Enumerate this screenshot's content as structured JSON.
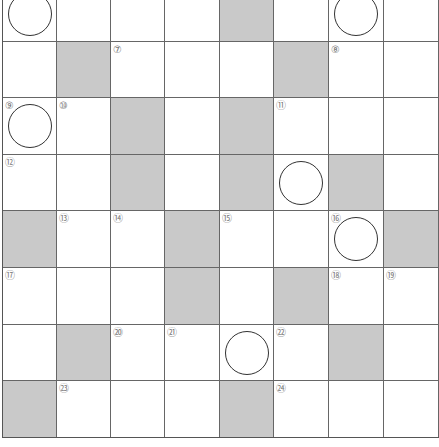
{
  "puzzle": {
    "type": "crossword-grid",
    "rows": 8,
    "cols": 8,
    "colors": {
      "block": "#c9c9c9",
      "line": "#666666",
      "ring": "#333333",
      "number": "#777777"
    },
    "cells": [
      [
        {
          "b": 0,
          "n": "",
          "c": 1
        },
        {
          "b": 0,
          "n": "",
          "c": 0
        },
        {
          "b": 0,
          "n": "",
          "c": 0
        },
        {
          "b": 0,
          "n": "",
          "c": 0
        },
        {
          "b": 1,
          "n": "",
          "c": 0
        },
        {
          "b": 0,
          "n": "",
          "c": 0
        },
        {
          "b": 0,
          "n": "",
          "c": 1
        },
        {
          "b": 0,
          "n": "",
          "c": 0
        }
      ],
      [
        {
          "b": 0,
          "n": "",
          "c": 0
        },
        {
          "b": 1,
          "n": "",
          "c": 0
        },
        {
          "b": 0,
          "n": "⑦",
          "c": 0
        },
        {
          "b": 0,
          "n": "",
          "c": 0
        },
        {
          "b": 0,
          "n": "",
          "c": 0
        },
        {
          "b": 1,
          "n": "",
          "c": 0
        },
        {
          "b": 0,
          "n": "⑧",
          "c": 0
        },
        {
          "b": 0,
          "n": "",
          "c": 0
        }
      ],
      [
        {
          "b": 0,
          "n": "⑨",
          "c": 1
        },
        {
          "b": 0,
          "n": "⑩",
          "c": 0
        },
        {
          "b": 1,
          "n": "",
          "c": 0
        },
        {
          "b": 0,
          "n": "",
          "c": 0
        },
        {
          "b": 1,
          "n": "",
          "c": 0
        },
        {
          "b": 0,
          "n": "⑪",
          "c": 0
        },
        {
          "b": 0,
          "n": "",
          "c": 0
        },
        {
          "b": 0,
          "n": "",
          "c": 0
        }
      ],
      [
        {
          "b": 0,
          "n": "⑫",
          "c": 0
        },
        {
          "b": 0,
          "n": "",
          "c": 0
        },
        {
          "b": 1,
          "n": "",
          "c": 0
        },
        {
          "b": 0,
          "n": "",
          "c": 0
        },
        {
          "b": 1,
          "n": "",
          "c": 0
        },
        {
          "b": 0,
          "n": "",
          "c": 1
        },
        {
          "b": 1,
          "n": "",
          "c": 0
        },
        {
          "b": 0,
          "n": "",
          "c": 0
        }
      ],
      [
        {
          "b": 1,
          "n": "",
          "c": 0
        },
        {
          "b": 0,
          "n": "⑬",
          "c": 0
        },
        {
          "b": 0,
          "n": "⑭",
          "c": 0
        },
        {
          "b": 1,
          "n": "",
          "c": 0
        },
        {
          "b": 0,
          "n": "⑮",
          "c": 0
        },
        {
          "b": 0,
          "n": "",
          "c": 0
        },
        {
          "b": 0,
          "n": "⑯",
          "c": 1
        },
        {
          "b": 1,
          "n": "",
          "c": 0
        }
      ],
      [
        {
          "b": 0,
          "n": "⑰",
          "c": 0
        },
        {
          "b": 0,
          "n": "",
          "c": 0
        },
        {
          "b": 0,
          "n": "",
          "c": 0
        },
        {
          "b": 1,
          "n": "",
          "c": 0
        },
        {
          "b": 0,
          "n": "",
          "c": 0
        },
        {
          "b": 1,
          "n": "",
          "c": 0
        },
        {
          "b": 0,
          "n": "⑱",
          "c": 0
        },
        {
          "b": 0,
          "n": "⑲",
          "c": 0
        }
      ],
      [
        {
          "b": 0,
          "n": "",
          "c": 0
        },
        {
          "b": 1,
          "n": "",
          "c": 0
        },
        {
          "b": 0,
          "n": "⑳",
          "c": 0
        },
        {
          "b": 0,
          "n": "㉑",
          "c": 0
        },
        {
          "b": 0,
          "n": "",
          "c": 1
        },
        {
          "b": 0,
          "n": "㉒",
          "c": 0
        },
        {
          "b": 1,
          "n": "",
          "c": 0
        },
        {
          "b": 0,
          "n": "",
          "c": 0
        }
      ],
      [
        {
          "b": 1,
          "n": "",
          "c": 0
        },
        {
          "b": 0,
          "n": "㉓",
          "c": 0
        },
        {
          "b": 0,
          "n": "",
          "c": 0
        },
        {
          "b": 0,
          "n": "",
          "c": 0
        },
        {
          "b": 1,
          "n": "",
          "c": 0
        },
        {
          "b": 0,
          "n": "㉔",
          "c": 0
        },
        {
          "b": 0,
          "n": "",
          "c": 0
        },
        {
          "b": 0,
          "n": "",
          "c": 0
        }
      ]
    ]
  }
}
